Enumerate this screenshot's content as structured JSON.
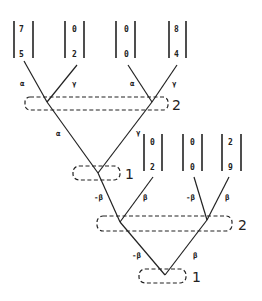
{
  "diagram": {
    "vectors": [
      {
        "top": "7",
        "bottom": "5"
      },
      {
        "top": "0",
        "bottom": "2"
      },
      {
        "top": "0",
        "bottom": "0"
      },
      {
        "top": "8",
        "bottom": "4"
      },
      {
        "top": "0",
        "bottom": "2"
      },
      {
        "top": "0",
        "bottom": "0"
      },
      {
        "top": "2",
        "bottom": "9"
      }
    ],
    "edge_labels": {
      "l1_left_a": "α",
      "l1_left_g": "γ",
      "l1_right_a": "α",
      "l1_right_g": "γ",
      "l2_a": "α",
      "l2_g": "γ",
      "l3_left_nb": "-β",
      "l3_left_b": "β",
      "l3_right_nb": "-β",
      "l3_right_b": "β",
      "l4_nb": "-β",
      "l4_b": "β"
    },
    "groups": [
      {
        "label": "2"
      },
      {
        "label": "1"
      },
      {
        "label": "2"
      },
      {
        "label": "1"
      }
    ]
  }
}
